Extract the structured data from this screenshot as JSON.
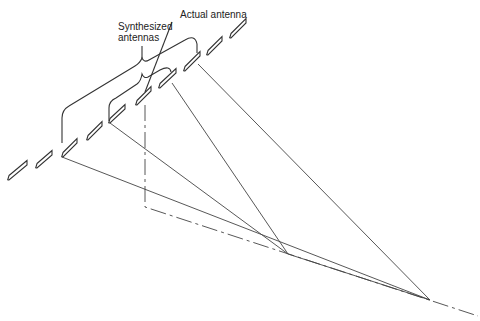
{
  "labels": {
    "synthesized_line1": "Synthesized",
    "synthesized_line2": "antennas",
    "actual": "Actual antenna"
  },
  "colors": {
    "stroke": "#333333",
    "background": "#ffffff"
  },
  "elements": [
    {
      "x1": 8,
      "y1": 180,
      "x2": 27,
      "y2": 165
    },
    {
      "x1": 36,
      "y1": 168,
      "x2": 52,
      "y2": 155
    },
    {
      "x1": 62,
      "y1": 157,
      "x2": 77,
      "y2": 143
    },
    {
      "x1": 87,
      "y1": 140,
      "x2": 102,
      "y2": 126
    },
    {
      "x1": 109,
      "y1": 123,
      "x2": 125,
      "y2": 109
    },
    {
      "x1": 136,
      "y1": 105,
      "x2": 151,
      "y2": 91
    },
    {
      "x1": 159,
      "y1": 88,
      "x2": 176,
      "y2": 73
    },
    {
      "x1": 184,
      "y1": 71,
      "x2": 200,
      "y2": 56
    },
    {
      "x1": 207,
      "y1": 55,
      "x2": 222,
      "y2": 41
    },
    {
      "x1": 230,
      "y1": 38,
      "x2": 246,
      "y2": 23
    }
  ],
  "rays": [
    {
      "from": [
        62,
        157
      ],
      "to": [
        430,
        300
      ]
    },
    {
      "from": [
        110,
        123
      ],
      "to": [
        288,
        254
      ]
    },
    {
      "from": [
        172,
        83
      ],
      "to": [
        288,
        254
      ]
    },
    {
      "from": [
        198,
        64
      ],
      "to": [
        430,
        300
      ]
    },
    {
      "from": [
        288,
        254
      ],
      "to": [
        430,
        300
      ]
    }
  ],
  "actual_antenna_path": {
    "top": [
      145,
      105
    ],
    "corner": [
      145,
      207
    ],
    "end": [
      478,
      316
    ]
  },
  "brackets": {
    "outer": {
      "left": [
        62,
        142
      ],
      "right": [
        198,
        53
      ],
      "apex": [
        142,
        55
      ]
    },
    "inner": {
      "left": [
        110,
        110
      ],
      "right": [
        172,
        72
      ],
      "apex": [
        143,
        72
      ]
    }
  }
}
